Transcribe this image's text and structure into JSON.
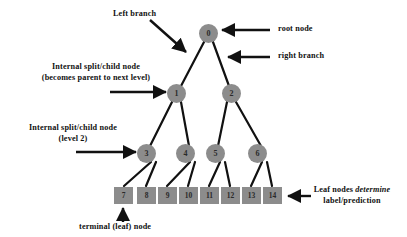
{
  "diagram": {
    "background_color": "#ffffff",
    "node_color": "#8c8c8c",
    "edge_color": "#111111",
    "text_color": "#111111"
  },
  "nodes": [
    {
      "id": "n0",
      "label": "0",
      "type": "root",
      "x": 208,
      "y": 33
    },
    {
      "id": "n1",
      "label": "1",
      "type": "internal",
      "x": 176,
      "y": 93
    },
    {
      "id": "n2",
      "label": "2",
      "type": "internal",
      "x": 231,
      "y": 93
    },
    {
      "id": "n3",
      "label": "3",
      "type": "internal",
      "x": 146,
      "y": 153
    },
    {
      "id": "n4",
      "label": "4",
      "type": "internal",
      "x": 185,
      "y": 153
    },
    {
      "id": "n5",
      "label": "5",
      "type": "internal",
      "x": 215,
      "y": 153
    },
    {
      "id": "n6",
      "label": "6",
      "type": "internal",
      "x": 257,
      "y": 153
    }
  ],
  "leaves": [
    {
      "id": "l7",
      "label": "7",
      "x": 114,
      "y": 187
    },
    {
      "id": "l8",
      "label": "8",
      "x": 137,
      "y": 187
    },
    {
      "id": "l9",
      "label": "9",
      "x": 158,
      "y": 187
    },
    {
      "id": "l10",
      "label": "10",
      "x": 179,
      "y": 187
    },
    {
      "id": "l11",
      "label": "11",
      "x": 200,
      "y": 187
    },
    {
      "id": "l12",
      "label": "12",
      "x": 221,
      "y": 187
    },
    {
      "id": "l13",
      "label": "13",
      "x": 242,
      "y": 187
    },
    {
      "id": "l14",
      "label": "14",
      "x": 263,
      "y": 187
    }
  ],
  "edges": [
    {
      "from": "n0",
      "to": "n1",
      "name": "root-left-branch"
    },
    {
      "from": "n0",
      "to": "n2",
      "name": "root-right-branch"
    },
    {
      "from": "n1",
      "to": "n3",
      "name": "edge-1-3"
    },
    {
      "from": "n1",
      "to": "n4",
      "name": "edge-1-4"
    },
    {
      "from": "n2",
      "to": "n5",
      "name": "edge-2-5"
    },
    {
      "from": "n2",
      "to": "n6",
      "name": "edge-2-6"
    },
    {
      "from": "n3",
      "to": "l7",
      "name": "edge-3-7"
    },
    {
      "from": "n3",
      "to": "l8",
      "name": "edge-3-8"
    },
    {
      "from": "n4",
      "to": "l9",
      "name": "edge-4-9"
    },
    {
      "from": "n4",
      "to": "l10",
      "name": "edge-4-10"
    },
    {
      "from": "n5",
      "to": "l11",
      "name": "edge-5-11"
    },
    {
      "from": "n5",
      "to": "l12",
      "name": "edge-5-12"
    },
    {
      "from": "n6",
      "to": "l13",
      "name": "edge-6-13"
    },
    {
      "from": "n6",
      "to": "l14",
      "name": "edge-6-14"
    }
  ],
  "annotations": {
    "left_branch": "Left  branch",
    "root_node": "root node",
    "right_branch": "right branch",
    "internal_split_line1": "Internal split/child  node",
    "internal_split_line2": "(becomes parent to next level)",
    "internal_level2_line1": "Internal split/child node",
    "internal_level2_line2": "(level 2)",
    "leaf_determine_line1a": "Leaf nodes ",
    "leaf_determine_line1b": "determine",
    "leaf_determine_line2": "label/prediction",
    "terminal_leaf": "terminal (leaf) node"
  }
}
